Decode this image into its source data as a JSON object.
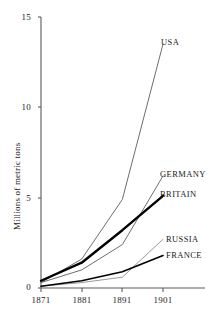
{
  "chart_data": {
    "type": "line",
    "title": "",
    "subtitle": "",
    "xlabel": "",
    "ylabel": "Millions of metric tons",
    "x": [
      1871,
      1881,
      1891,
      1901
    ],
    "xticklabels": [
      "1871",
      "1881",
      "1891",
      "1901"
    ],
    "yticks": [
      0,
      5,
      10,
      15
    ],
    "yticklabels": [
      "0",
      "5",
      "10",
      "15"
    ],
    "xlim": [
      1871,
      1903
    ],
    "ylim": [
      0,
      15
    ],
    "grid": false,
    "legend": "inline-right-of-line-ends",
    "annotations": [
      "USA",
      "GERMANY",
      "BRITAIN",
      "RUSSIA",
      "FRANCE"
    ],
    "series": [
      {
        "name": "USA",
        "label": "USA",
        "color": "#6e6e6e",
        "linewidth": 1,
        "values": [
          0.3,
          1.6,
          4.9,
          13.5
        ]
      },
      {
        "name": "GERMANY",
        "label": "GERMANY",
        "color": "#6e6e6e",
        "linewidth": 1,
        "values": [
          0.3,
          1.0,
          2.4,
          6.2
        ]
      },
      {
        "name": "BRITAIN",
        "label": "BRITAIN",
        "color": "#000000",
        "linewidth": 2.4,
        "values": [
          0.4,
          1.4,
          3.2,
          5.1
        ]
      },
      {
        "name": "RUSSIA",
        "label": "RUSSIA",
        "color": "#9a9a9a",
        "linewidth": 1,
        "values": [
          0.1,
          0.3,
          0.6,
          2.7
        ]
      },
      {
        "name": "FRANCE",
        "label": "FRANCE",
        "color": "#000000",
        "linewidth": 1.6,
        "values": [
          0.1,
          0.4,
          0.9,
          1.8
        ]
      }
    ]
  },
  "axis": {
    "y_title": "Millions of metric tons",
    "y_ticks": [
      "15",
      "10",
      "5",
      "0"
    ],
    "x_ticks": [
      "1871",
      "1881",
      "1891",
      "1901"
    ],
    "axis_color": "#4d4d4d"
  },
  "labels": {
    "usa": "USA",
    "germany": "GERMANY",
    "britain": "BRITAIN",
    "russia": "RUSSIA",
    "france": "FRANCE"
  }
}
